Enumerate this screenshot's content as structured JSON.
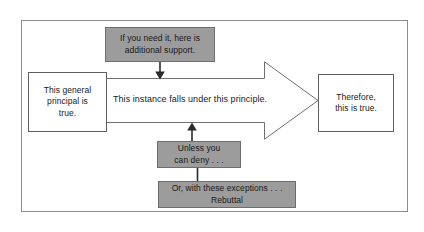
{
  "diagram": {
    "frame": {
      "border_color": "#8d8d8d"
    },
    "colors": {
      "support_fill": "#9c9c9c",
      "box_fill": "#ffffff",
      "stroke": "#5f5f5f",
      "text": "#1a1a1a"
    },
    "nodes": {
      "warrant_support": {
        "label": "If you need it, here is additional support.",
        "line1": "If you need it, here is",
        "line2": "additional support.",
        "style": "gray"
      },
      "claim_general": {
        "label": "This general principal is true.",
        "line1": "This general",
        "line2": "principal is",
        "line3": "true.",
        "style": "white"
      },
      "bridge": {
        "label": "This instance falls under this principle."
      },
      "conclusion": {
        "label": "Therefore, this is true.",
        "line1": "Therefore,",
        "line2": "this is true.",
        "style": "white"
      },
      "rebuttal_unless": {
        "label": "Unless you can deny . . .",
        "line1": "Unless you",
        "line2": "can deny . . .",
        "style": "gray"
      },
      "rebuttal_exceptions": {
        "label": "Or, with these exceptions . . . Rebuttal",
        "line1": "Or, with these exceptions . . .",
        "line2": "Rebuttal",
        "style": "gray"
      }
    },
    "connectors": {
      "support_down": "arrow-down-icon",
      "rebuttal_up": "arrow-up-icon",
      "rebuttal_link": "connector-line",
      "main_flow": "block-arrow-right-icon"
    }
  }
}
